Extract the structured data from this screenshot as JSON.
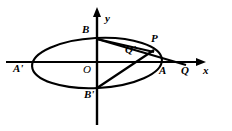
{
  "figure": {
    "type": "geometry-diagram",
    "width": 232,
    "height": 131,
    "stroke_color": "#000000",
    "background_color": "#ffffff"
  },
  "axes": {
    "x_label": "x",
    "y_label": "y",
    "origin_label": "O",
    "x_axis": {
      "x1": 6,
      "y1": 62,
      "x2": 205,
      "y2": 62,
      "arrow": "right"
    },
    "y_axis": {
      "x1": 97,
      "y1": 125,
      "x2": 97,
      "y2": 8,
      "arrow": "up"
    }
  },
  "ellipse": {
    "cx": 97,
    "cy": 63,
    "rx": 65,
    "ry": 25,
    "rotation_deg": -3
  },
  "points": [
    {
      "name": "A'",
      "label": "A'",
      "x": 32,
      "y": 63,
      "label_x": 14,
      "label_y": 66
    },
    {
      "name": "A",
      "label": "A",
      "x": 162,
      "y": 63,
      "label_x": 161,
      "label_y": 67
    },
    {
      "name": "B",
      "label": "B",
      "x": 97,
      "y": 39,
      "label_x": 83,
      "label_y": 27
    },
    {
      "name": "B'",
      "label": "B'",
      "x": 97,
      "y": 88,
      "label_x": 85,
      "label_y": 91
    },
    {
      "name": "P",
      "label": "P",
      "x": 152,
      "y": 49,
      "label_x": 153,
      "label_y": 37
    },
    {
      "name": "Q'",
      "label": "Q'",
      "x": 141,
      "y": 59,
      "label_x": 126,
      "label_y": 47
    },
    {
      "name": "Q",
      "label": "Q",
      "x": 181,
      "y": 62,
      "label_x": 183,
      "label_y": 67
    },
    {
      "name": "O",
      "label": "O",
      "x": 97,
      "y": 62,
      "label_x": 84,
      "label_y": 66
    }
  ],
  "segments": [
    {
      "name": "B-to-Q",
      "from": "B",
      "to": "Q",
      "x1": 97,
      "y1": 39,
      "x2": 186,
      "y2": 65
    },
    {
      "name": "B-to-P",
      "from": "B",
      "to": "P",
      "x1": 97,
      "y1": 39,
      "x2": 153,
      "y2": 51
    },
    {
      "name": "Bprime-to-P",
      "from": "B'",
      "to": "P",
      "x1": 97,
      "y1": 88,
      "x2": 153,
      "y2": 50
    }
  ],
  "axis_labels": {
    "x": "x",
    "y": "y"
  }
}
